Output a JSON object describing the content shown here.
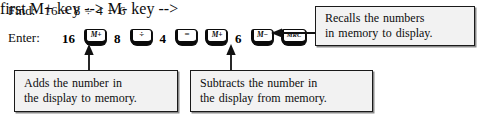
{
  "figure": {
    "find": {
      "label": "Find:",
      "expression": "16 + 8 ÷ 4 − 6"
    },
    "enter": {
      "label": "Enter:",
      "sequence": [
        {
          "kind": "number",
          "text": "16"
        },
        {
          "kind": "key",
          "text": "M+",
          "icon": "memory-plus-key",
          "style": "mem"
        },
        {
          "kind": "number",
          "text": "8"
        },
        {
          "kind": "key",
          "text": "÷",
          "icon": "divide-key",
          "style": "op"
        },
        {
          "kind": "number",
          "text": "4"
        },
        {
          "kind": "key",
          "text": "=",
          "icon": "equals-key",
          "style": "op"
        },
        {
          "kind": "key",
          "text": "M+",
          "icon": "memory-plus-key",
          "style": "mem"
        },
        {
          "kind": "number",
          "text": "6"
        },
        {
          "kind": "key",
          "text": "M−",
          "icon": "memory-minus-key",
          "style": "mem"
        },
        {
          "kind": "key",
          "text": "MRC",
          "icon": "memory-recall-clear-key",
          "style": "wide"
        }
      ]
    },
    "callouts": {
      "recall": {
        "lines": [
          "Recalls the numbers",
          "in memory to display."
        ]
      },
      "add": {
        "lines": [
          "Adds the number in",
          "the display to memory."
        ]
      },
      "subtract": {
        "lines": [
          "Subtracts the number in",
          "the display from memory."
        ]
      }
    },
    "colors": {
      "ink": "#0d0d0d",
      "box_fill": "#f2f2f2",
      "box_border": "#1a1a1a",
      "box_shadow": "#8a8a8a",
      "page": "#ffffff"
    }
  }
}
